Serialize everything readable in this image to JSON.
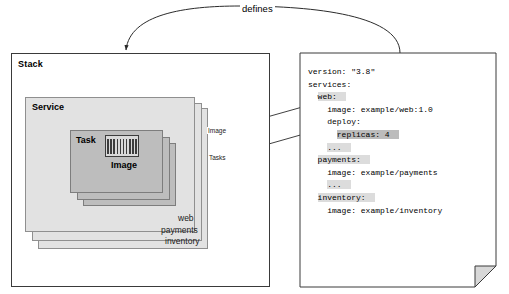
{
  "diagram": {
    "defines_label": "defines"
  },
  "stack": {
    "label": "Stack",
    "service_label": "Service",
    "task_label": "Task",
    "image_label": "Image",
    "services": [
      {
        "name": "web"
      },
      {
        "name": "payments"
      },
      {
        "name": "inventory"
      }
    ],
    "connectors": [
      {
        "label": "Image",
        "target": "image-icon"
      },
      {
        "label": "Tasks",
        "target": "task-stack"
      }
    ]
  },
  "document": {
    "lines": [
      {
        "text": "version: \"3.8\"",
        "highlight": "none"
      },
      {
        "text": "services:",
        "highlight": "none"
      },
      {
        "text": "  web:",
        "highlight": "light"
      },
      {
        "text": "    image: example/web:1.0",
        "highlight": "none"
      },
      {
        "text": "    deploy:",
        "highlight": "none"
      },
      {
        "text": "      replicas: 4",
        "highlight": "dark"
      },
      {
        "text": "    ...",
        "highlight": "light"
      },
      {
        "text": "  payments:",
        "highlight": "light"
      },
      {
        "text": "    image: example/payments",
        "highlight": "none"
      },
      {
        "text": "    ...",
        "highlight": "light"
      },
      {
        "text": "  inventory:",
        "highlight": "light"
      },
      {
        "text": "    image: example/inventory",
        "highlight": "none"
      }
    ],
    "version": "3.8",
    "services": {
      "web": {
        "image": "example/web:1.0",
        "replicas": "4"
      },
      "payments": {
        "image": "example/payments"
      },
      "inventory": {
        "image": "example/inventory"
      }
    }
  },
  "colors": {
    "service_fill": "#e2e2e2",
    "task_fill": "#bdbdbd",
    "stroke": "#3a3a3a",
    "highlight_light": "#dcdcdc",
    "highlight_dark": "#bcbcbc"
  }
}
